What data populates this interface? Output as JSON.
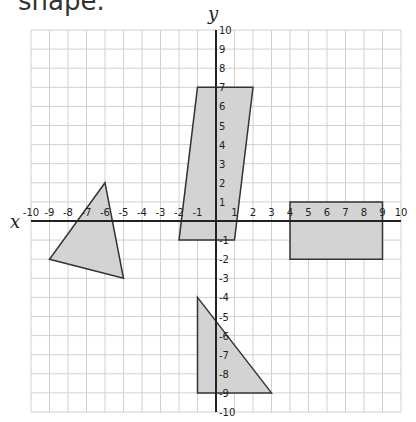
{
  "caption": "shape.",
  "axes": {
    "x_label": "x",
    "y_label": "y",
    "x_range": [
      -10,
      10
    ],
    "y_range": [
      -10,
      10
    ],
    "x_ticks": [
      "-10",
      "-9",
      "-8",
      "-7",
      "-6",
      "-5",
      "-4",
      "-3",
      "-2",
      "-1",
      "1",
      "2",
      "3",
      "4",
      "5",
      "6",
      "7",
      "8",
      "9",
      "10"
    ],
    "y_ticks": [
      "10",
      "9",
      "8",
      "7",
      "6",
      "5",
      "4",
      "3",
      "2",
      "1",
      "-1",
      "-2",
      "-3",
      "-4",
      "-5",
      "-6",
      "-7",
      "-8",
      "-9",
      "-10"
    ]
  },
  "colors": {
    "grid": "#d0d0d0",
    "axis": "#222222",
    "shape_fill": "#d3d3d3",
    "shape_stroke": "#333333"
  },
  "shapes": [
    {
      "name": "left-triangle",
      "points": [
        [
          -6,
          2
        ],
        [
          -9,
          -2
        ],
        [
          -5,
          -3
        ]
      ]
    },
    {
      "name": "parallelogram",
      "points": [
        [
          -1,
          7
        ],
        [
          2,
          7
        ],
        [
          1,
          -1
        ],
        [
          -2,
          -1
        ]
      ]
    },
    {
      "name": "rectangle",
      "points": [
        [
          4,
          1
        ],
        [
          9,
          1
        ],
        [
          9,
          -2
        ],
        [
          4,
          -2
        ]
      ]
    },
    {
      "name": "bottom-triangle",
      "points": [
        [
          -1,
          -4
        ],
        [
          -1,
          -9
        ],
        [
          3,
          -9
        ]
      ]
    }
  ]
}
